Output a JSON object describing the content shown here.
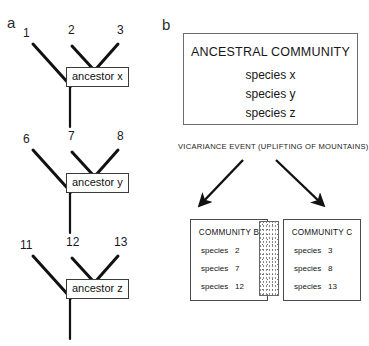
{
  "figure": {
    "panel_a_letter": "a",
    "panel_b_letter": "b"
  },
  "panel_a": {
    "trees": [
      {
        "tips": [
          "1",
          "2",
          "3"
        ],
        "ancestor_label": "ancestor x"
      },
      {
        "tips": [
          "6",
          "7",
          "8"
        ],
        "ancestor_label": "ancestor y"
      },
      {
        "tips": [
          "11",
          "12",
          "13"
        ],
        "ancestor_label": "ancestor z"
      }
    ]
  },
  "panel_b": {
    "ancestral_community": {
      "title": "ANCESTRAL COMMUNITY",
      "species": [
        "species x",
        "species y",
        "species z"
      ]
    },
    "event_label": "VICARIANCE EVENT (UPLIFTING OF MOUNTAINS)",
    "barrier": "stippled-mountain-barrier",
    "communities": [
      {
        "title": "COMMUNITY B",
        "species": [
          {
            "word": "species",
            "number": "2"
          },
          {
            "word": "species",
            "number": "7"
          },
          {
            "word": "species",
            "number": "12"
          }
        ]
      },
      {
        "title": "COMMUNITY C",
        "species": [
          {
            "word": "species",
            "number": "3"
          },
          {
            "word": "species",
            "number": "8"
          },
          {
            "word": "species",
            "number": "13"
          }
        ]
      }
    ]
  },
  "colors": {
    "ink": "#1a1a1a",
    "box_border": "#4a4a4a",
    "background": "#ffffff"
  }
}
